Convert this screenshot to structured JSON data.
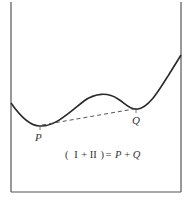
{
  "diagram": {
    "type": "potential-energy-curve",
    "frame": {
      "left_x": 11,
      "right_x": 181,
      "bottom_y": 192,
      "top_open": true
    },
    "points": [
      {
        "id": "P",
        "label": "P",
        "x": 40,
        "y": 126,
        "role": "left-minimum"
      },
      {
        "id": "Q",
        "label": "Q",
        "x": 136,
        "y": 109,
        "role": "right-minimum"
      }
    ],
    "connector": {
      "from": "P",
      "to": "Q",
      "style": "dashed"
    },
    "equation": {
      "open_paren": "(",
      "term1": "I",
      "plus": "+",
      "term2": "II",
      "close_paren": ")",
      "equals": "=",
      "rhs_var1": "P",
      "rhs_plus": "+",
      "rhs_var2": "Q"
    },
    "colors": {
      "curve": "#2a2a2a",
      "frame": "#555555",
      "text": "#333333",
      "background": "#ffffff"
    }
  }
}
